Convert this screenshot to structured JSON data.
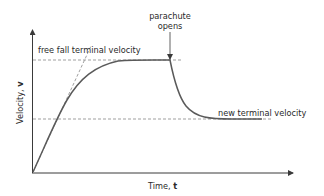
{
  "diagram": {
    "y_axis": {
      "label": "Velocity, ",
      "symbol": "v"
    },
    "x_axis": {
      "label": "Time, ",
      "symbol": "t"
    },
    "annotations": {
      "free_fall": "free fall terminal velocity",
      "parachute_line1": "parachute",
      "parachute_line2": "opens",
      "new_terminal": "new terminal velocity"
    },
    "colors": {
      "curve": "#5a5a5a",
      "axis": "#3a3a3a",
      "dashed": "#777777",
      "text": "#2a2a2a"
    }
  }
}
